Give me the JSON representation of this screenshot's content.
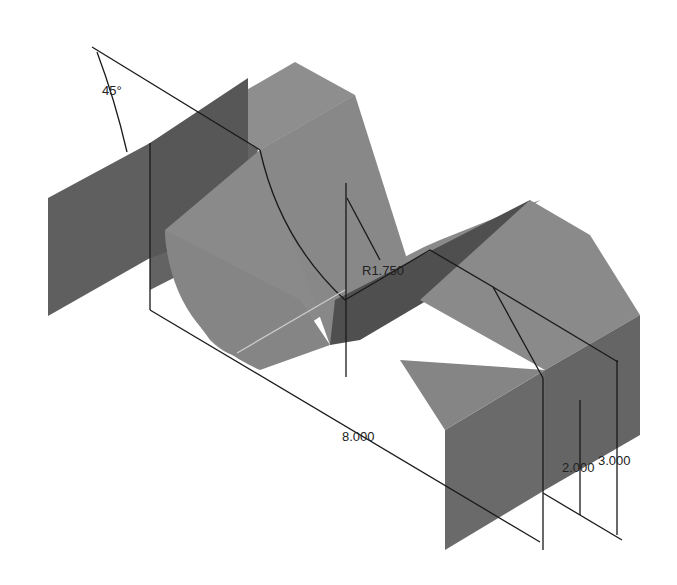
{
  "drawing": {
    "title": "Isometric view of channel part with cylindrical cutout",
    "colors": {
      "background": "#ffffff",
      "face_dark": "#5f5f5f",
      "face_mid": "#7a7a7a",
      "face_light": "#9a9a9a",
      "cylinder": "#8c8c8c",
      "line": "#1a1a1a"
    },
    "dimensions": {
      "angle": "45°",
      "radius": "R1.750",
      "length": "8.000",
      "height_inner": "2.000",
      "height_outer": "3.000"
    }
  }
}
